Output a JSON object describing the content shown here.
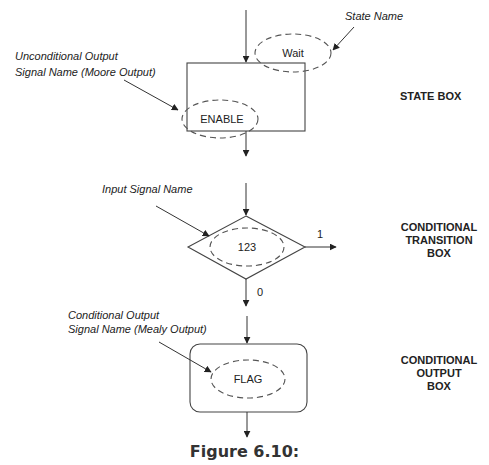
{
  "figure": {
    "caption": "Figure 6.10:",
    "state_box": {
      "title": "STATE BOX",
      "state_name_label": "State Name",
      "state_name_value": "Wait",
      "output_label_line1": "Unconditional Output",
      "output_label_line2": "Signal Name (Moore Output)",
      "output_value": "ENABLE"
    },
    "conditional_transition_box": {
      "title_line1": "CONDITIONAL",
      "title_line2": "TRANSITION",
      "title_line3": "BOX",
      "input_label": "Input Signal Name",
      "input_value": "123",
      "true_branch": "1",
      "false_branch": "0"
    },
    "conditional_output_box": {
      "title_line1": "CONDITIONAL",
      "title_line2": "OUTPUT",
      "title_line3": "BOX",
      "output_label_line1": "Conditional Output",
      "output_label_line2": "Signal Name (Mealy Output)",
      "output_value": "FLAG"
    }
  }
}
